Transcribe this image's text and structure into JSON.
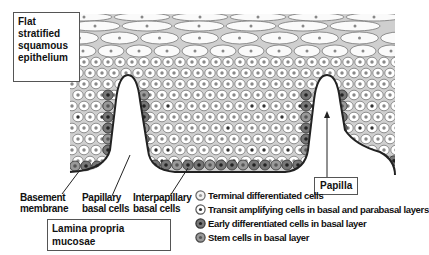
{
  "title_box": {
    "lines": [
      "Flat",
      "stratified",
      "squamous",
      "epithelium"
    ]
  },
  "labels": {
    "basement_membrane": [
      "Basement",
      "membrane"
    ],
    "papillary_basal": [
      "Papillary",
      "basal cells"
    ],
    "interpapillary_basal": [
      "Interpapillary",
      "basal cells"
    ],
    "papilla": "Papilla",
    "lamina": "Lamina propria mucosae"
  },
  "legend": [
    {
      "label": "Terminal differentiated cells",
      "fill": "#f2f2f2",
      "ring": "#666",
      "nucleus": "#999"
    },
    {
      "label": "Transit amplifying cells in basal and parabasal layers",
      "fill": "#ffffff",
      "ring": "#555",
      "nucleus": "#333"
    },
    {
      "label": "Early differentiated cells in basal layer",
      "fill": "#777777",
      "ring": "#333",
      "nucleus": "#222"
    },
    {
      "label": "Stem cells in basal layer",
      "fill": "#999999",
      "ring": "#444",
      "nucleus": "#555"
    }
  ],
  "colors": {
    "tissue_bg": "#cfcfcf",
    "cell_outline": "#777777",
    "membrane": "#222222"
  }
}
